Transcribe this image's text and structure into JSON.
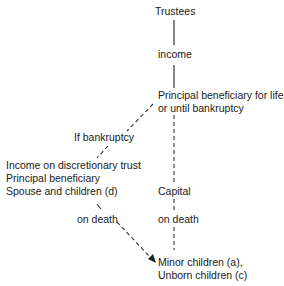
{
  "diagram": {
    "type": "trust-flow",
    "nodes": {
      "trustees": "Trustees",
      "income": "income",
      "principal_line1": "Principal beneficiary for life",
      "principal_line2": "or until bankruptcy",
      "if_bankruptcy": "If bankruptcy",
      "discretionary_line1": "Income on discretionary trust",
      "discretionary_line2": "Principal beneficiary",
      "discretionary_line3": "Spouse and children (d)",
      "capital": "Capital",
      "on_death_left": "on death",
      "on_death_right": "on death",
      "minor_line1": "Minor children (a),",
      "minor_line2": "Unborn children (c)"
    },
    "edges": [
      {
        "from": "Trustees",
        "to": "income",
        "style": "solid"
      },
      {
        "from": "income",
        "to": "Principal beneficiary",
        "style": "solid"
      },
      {
        "from": "Principal beneficiary",
        "to": "If bankruptcy",
        "style": "dashed"
      },
      {
        "from": "If bankruptcy",
        "to": "Income on discretionary trust",
        "style": "dashed"
      },
      {
        "from": "Principal beneficiary",
        "to": "Capital",
        "style": "dashed"
      },
      {
        "from": "Capital",
        "to": "on death",
        "style": "dashed"
      },
      {
        "from": "on death",
        "to": "Minor children",
        "style": "dashed"
      },
      {
        "from": "Spouse and children (d)",
        "to": "Minor children",
        "style": "dashed-arrow",
        "label": "on death"
      }
    ],
    "line_color": "#333333"
  }
}
